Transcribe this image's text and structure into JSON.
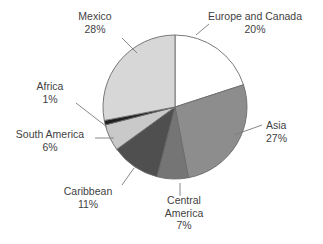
{
  "chart_data": {
    "type": "pie",
    "title": "",
    "subtitle": "",
    "xlabel": "",
    "ylabel": "",
    "legend_position": "none",
    "grid": false,
    "units": "percent",
    "start_angle_deg": 0,
    "direction": "clockwise",
    "categories": [
      "Europe and Canada",
      "Asia",
      "Central America",
      "Caribbean",
      "South America",
      "Africa",
      "Mexico"
    ],
    "values": [
      20,
      27,
      7,
      11,
      6,
      1,
      28
    ],
    "slices": [
      {
        "label": "Europe and Canada",
        "value": 20,
        "value_text": "20%",
        "color": "#ffffff",
        "label_lines": [
          "Europe and Canada",
          "20%"
        ]
      },
      {
        "label": "Asia",
        "value": 27,
        "value_text": "27%",
        "color": "#8d8d8d",
        "label_lines": [
          "Asia",
          "27%"
        ]
      },
      {
        "label": "Central America",
        "value": 7,
        "value_text": "7%",
        "color": "#757575",
        "label_lines": [
          "Central",
          "America",
          "7%"
        ]
      },
      {
        "label": "Caribbean",
        "value": 11,
        "value_text": "11%",
        "color": "#4f4f4f",
        "label_lines": [
          "Caribbean",
          "11%"
        ]
      },
      {
        "label": "South America",
        "value": 6,
        "value_text": "6%",
        "color": "#c9c9c9",
        "label_lines": [
          "South America",
          "6%"
        ]
      },
      {
        "label": "Africa",
        "value": 1,
        "value_text": "1%",
        "color": "#1f1f1f",
        "label_lines": [
          "Africa",
          "1%"
        ]
      },
      {
        "label": "Mexico",
        "value": 28,
        "value_text": "28%",
        "color": "#d7d7d7",
        "label_lines": [
          "Mexico",
          "28%"
        ]
      }
    ]
  },
  "labels": {
    "europe": {
      "name": "Europe and Canada",
      "pct": "20%"
    },
    "asia": {
      "name": "Asia",
      "pct": "27%"
    },
    "central_america": {
      "name1": "Central",
      "name2": "America",
      "pct": "7%"
    },
    "caribbean": {
      "name": "Caribbean",
      "pct": "11%"
    },
    "south_america": {
      "name": "South America",
      "pct": "6%"
    },
    "africa": {
      "name": "Africa",
      "pct": "1%"
    },
    "mexico": {
      "name": "Mexico",
      "pct": "28%"
    }
  },
  "style": {
    "background": "#ffffff",
    "outline": "#6b6b6b",
    "leader": "#7a7a7a",
    "text": "#3f3f3f"
  }
}
